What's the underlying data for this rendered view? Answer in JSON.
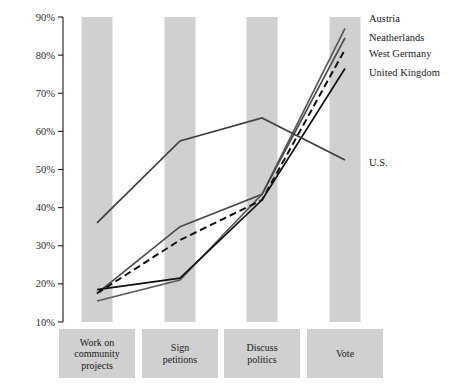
{
  "chart_data": {
    "type": "line",
    "title": "",
    "subtitle": "",
    "xlabel": "",
    "ylabel": "",
    "categories": [
      "Work on community projects",
      "Sign petitions",
      "Discuss politics",
      "Vote"
    ],
    "category_lines": [
      [
        "Work on",
        "community",
        "projects"
      ],
      [
        "Sign",
        "petitions"
      ],
      [
        "Discuss",
        "politics"
      ],
      [
        "Vote"
      ]
    ],
    "ylim": [
      10,
      90
    ],
    "ytick_labels": [
      "90%",
      "80%",
      "70%",
      "60%",
      "50%",
      "40%",
      "30%",
      "20%",
      "10%"
    ],
    "ytick_values": [
      90,
      80,
      70,
      60,
      50,
      40,
      30,
      20,
      10
    ],
    "grid": false,
    "banded_background": true,
    "legend_position": "right",
    "series": [
      {
        "name": "Austria",
        "values": [
          15.5,
          21,
          43.5,
          87
        ],
        "color": "#5a5a5a",
        "style": "solid"
      },
      {
        "name": "Neatherlands",
        "values": [
          17.5,
          35,
          43.5,
          84.5
        ],
        "color": "#4a4a4a",
        "style": "solid"
      },
      {
        "name": "West Germany",
        "values": [
          17.5,
          31.5,
          42,
          81.5
        ],
        "color": "#111111",
        "style": "dashed"
      },
      {
        "name": "United Kingdom",
        "values": [
          18.5,
          21.5,
          42,
          76.5
        ],
        "color": "#111111",
        "style": "solid"
      },
      {
        "name": "U.S.",
        "values": [
          36,
          57.5,
          63.5,
          52.5
        ],
        "color": "#3f3f3f",
        "style": "solid"
      }
    ]
  },
  "legend": {
    "entries": [
      "Austria",
      "Neatherlands",
      "West Germany",
      "United Kingdom"
    ],
    "us_entry": "U.S."
  },
  "colors": {
    "band": "#d0d0d0",
    "axis": "#1a1a1a",
    "text": "#1a1a1a",
    "background": "#ffffff"
  }
}
